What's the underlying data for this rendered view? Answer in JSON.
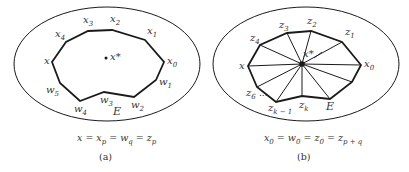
{
  "figure": {
    "colors": {
      "stroke": "#1a1a1a",
      "text": "#333333",
      "background": "#ffffff"
    },
    "panels": [
      {
        "id": "a",
        "caption": "(a)",
        "equation": {
          "parts": [
            "x",
            " = x",
            "p",
            " = w",
            "q",
            " = z",
            "p"
          ]
        },
        "region_label": "E",
        "center_label": "x*",
        "vertex_labels": {
          "x": "x",
          "x4": {
            "base": "x",
            "sub": "4"
          },
          "x3": {
            "base": "x",
            "sub": "3"
          },
          "x2": {
            "base": "x",
            "sub": "2"
          },
          "x1": {
            "base": "x",
            "sub": "1"
          },
          "x0": {
            "base": "x",
            "sub": "0"
          },
          "w1": {
            "base": "w",
            "sub": "1"
          },
          "w2": {
            "base": "w",
            "sub": "2"
          },
          "w3": {
            "base": "w",
            "sub": "3"
          },
          "w4": {
            "base": "w",
            "sub": "4"
          },
          "w5": {
            "base": "w",
            "sub": "5"
          }
        }
      },
      {
        "id": "b",
        "caption": "(b)",
        "equation": {
          "parts": [
            "x",
            "0",
            " = w",
            "0",
            " = z",
            "0",
            " = z",
            "p + q"
          ]
        },
        "region_label": "E",
        "center_label": "x*",
        "ellipsis": "...",
        "vertex_labels": {
          "x": "x",
          "z4": {
            "base": "z",
            "sub": "4"
          },
          "z3": {
            "base": "z",
            "sub": "3"
          },
          "z2": {
            "base": "z",
            "sub": "2"
          },
          "z1": {
            "base": "z",
            "sub": "1"
          },
          "x0": {
            "base": "x",
            "sub": "0"
          },
          "z6": {
            "base": "z",
            "sub": "6"
          },
          "zk1": {
            "base": "z",
            "sub": "k − 1"
          },
          "zk": {
            "base": "z",
            "sub": "k"
          }
        }
      }
    ]
  }
}
